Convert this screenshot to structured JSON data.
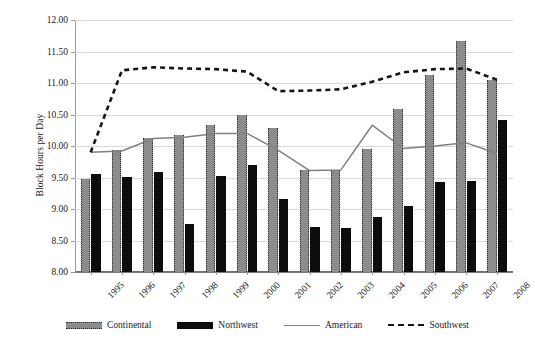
{
  "chart_data": {
    "type": "bar",
    "title": "",
    "subtitle": "",
    "xlabel": "",
    "ylabel": "Block Hours per Day",
    "ylim": [
      8.0,
      12.0
    ],
    "ytick_step": 0.5,
    "yticks": [
      "12.00",
      "11.50",
      "11.00",
      "10.50",
      "10.00",
      "9.50",
      "9.00",
      "8.50",
      "8.00"
    ],
    "grid": true,
    "legend_position": "bottom",
    "categories": [
      "1995",
      "1996",
      "1997",
      "1998",
      "1999",
      "2000",
      "2001",
      "2002",
      "2003",
      "2004",
      "2005",
      "2006",
      "2007",
      "2008"
    ],
    "series": [
      {
        "name": "Continental",
        "kind": "bar",
        "color": "#8c8c8c",
        "values": [
          9.47,
          9.93,
          10.13,
          10.18,
          10.33,
          10.5,
          10.28,
          9.62,
          9.62,
          9.95,
          10.58,
          11.12,
          11.67,
          11.05
        ]
      },
      {
        "name": "Northwest",
        "kind": "bar",
        "color": "#0d0d0d",
        "values": [
          9.56,
          9.51,
          9.59,
          8.76,
          9.52,
          9.7,
          9.16,
          8.72,
          8.7,
          8.88,
          9.04,
          9.43,
          9.45,
          10.41
        ]
      },
      {
        "name": "American",
        "kind": "line",
        "color": "#808080",
        "style": "solid",
        "values": [
          9.9,
          9.92,
          10.12,
          10.14,
          10.2,
          10.2,
          9.93,
          9.61,
          9.62,
          10.33,
          9.96,
          10.0,
          10.05,
          9.88
        ]
      },
      {
        "name": "Southwest",
        "kind": "line",
        "color": "#151515",
        "style": "dashed",
        "values": [
          9.9,
          11.2,
          11.25,
          11.23,
          11.22,
          11.18,
          10.87,
          10.88,
          10.9,
          11.02,
          11.17,
          11.22,
          11.23,
          11.05
        ]
      }
    ]
  },
  "legend": {
    "items": [
      {
        "label": "Continental",
        "swatch": "bar-continental"
      },
      {
        "label": "Northwest",
        "swatch": "bar-northwest"
      },
      {
        "label": "American",
        "swatch": "line-solid"
      },
      {
        "label": "Southwest",
        "swatch": "line-dashed"
      }
    ]
  }
}
